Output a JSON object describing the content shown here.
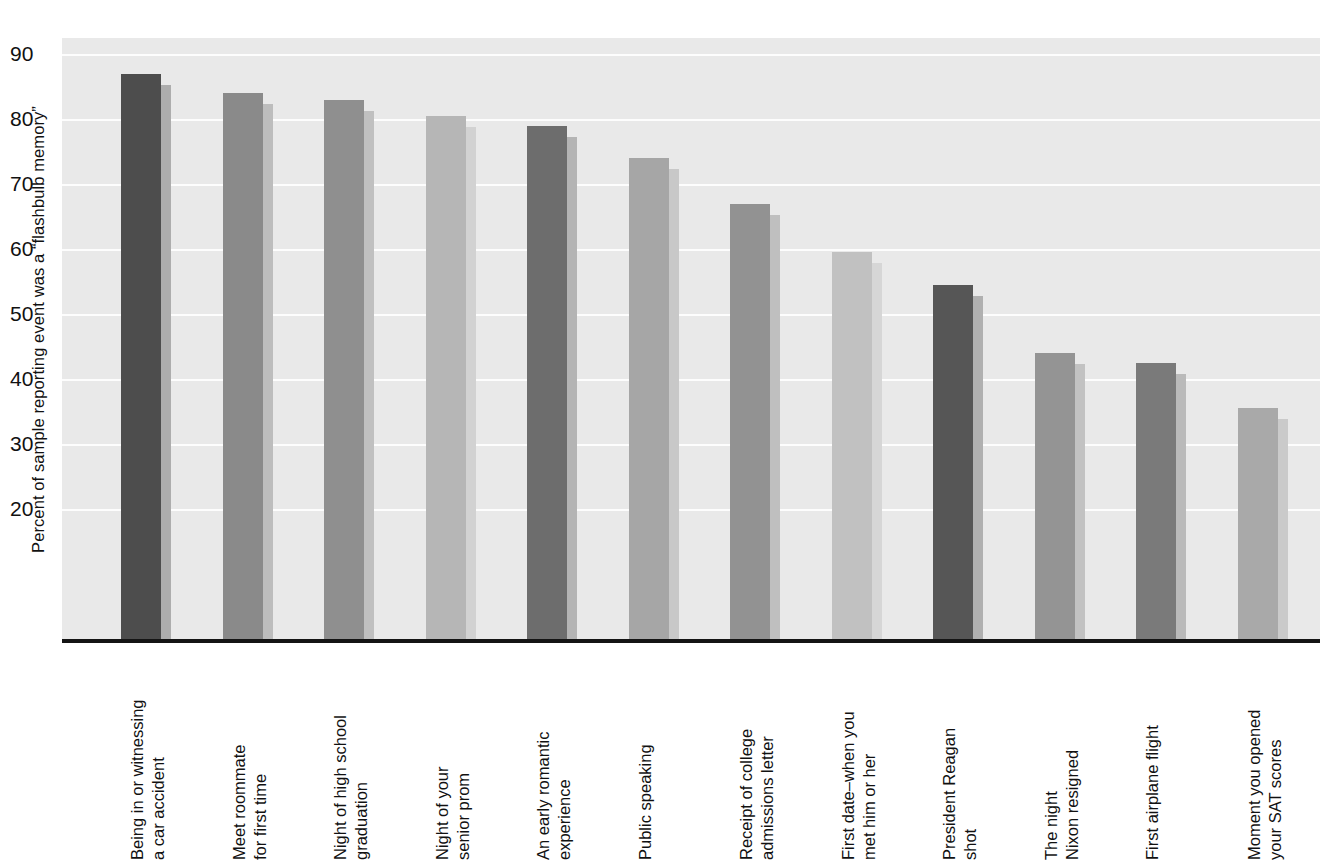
{
  "chart_data": {
    "type": "bar",
    "title": "",
    "xlabel": "",
    "ylabel": "Percent of sample reporting event was a “flashbulb memory”",
    "ylim": [
      0,
      95
    ],
    "yticks": [
      90,
      80,
      70,
      60,
      50,
      40,
      30,
      20
    ],
    "grid": true,
    "legend": "none",
    "categories": [
      "Being in or witnessing a car accident",
      "Meet roommate for first time",
      "Night of high school graduation",
      "Night of your senior prom",
      "An early romantic experience",
      "Public speaking",
      "Receipt of college admissions letter",
      "First date–when you met him or her",
      "President Reagan shot",
      "The night Nixon resigned",
      "First airplane flight",
      "Moment you opened your SAT scores"
    ],
    "values": [
      87,
      84,
      83,
      80.5,
      79,
      74,
      67,
      59.5,
      54.5,
      44,
      42.5,
      35.5
    ]
  },
  "axis": {
    "y_title": "Percent of sample reporting event was a “flashbulb memory”",
    "ticks": [
      {
        "value": 90,
        "label": "90"
      },
      {
        "value": 80,
        "label": "80"
      },
      {
        "value": 70,
        "label": "70"
      },
      {
        "value": 60,
        "label": "60"
      },
      {
        "value": 50,
        "label": "50"
      },
      {
        "value": 40,
        "label": "40"
      },
      {
        "value": 30,
        "label": "30"
      },
      {
        "value": 20,
        "label": "20"
      }
    ]
  },
  "bars": [
    {
      "line1": "Being in or witnessing",
      "line2": "a car accident",
      "value": 87,
      "face": "#4d4d4d",
      "side": "#adadad"
    },
    {
      "line1": "Meet roommate",
      "line2": "for first time",
      "value": 84,
      "face": "#8a8a8a",
      "side": "#bdbdbd"
    },
    {
      "line1": "Night of high school",
      "line2": "graduation",
      "value": 83,
      "face": "#8f8f8f",
      "side": "#c0c0c0"
    },
    {
      "line1": "Night of your",
      "line2": "senior prom",
      "value": 80.5,
      "face": "#b6b6b6",
      "side": "#d2d2d2"
    },
    {
      "line1": "An early romantic",
      "line2": "experience",
      "value": 79,
      "face": "#6d6d6d",
      "side": "#b4b4b4"
    },
    {
      "line1": "Public speaking",
      "line2": "",
      "value": 74,
      "face": "#a6a6a6",
      "side": "#c8c8c8"
    },
    {
      "line1": "Receipt of college",
      "line2": "admissions letter",
      "value": 67,
      "face": "#929292",
      "side": "#bfbfbf"
    },
    {
      "line1": "First date–when you",
      "line2": "met him or her",
      "value": 59.5,
      "face": "#c1c1c1",
      "side": "#d6d6d6"
    },
    {
      "line1": "President Reagan",
      "line2": "shot",
      "value": 54.5,
      "face": "#565656",
      "side": "#b0b0b0"
    },
    {
      "line1": "The night",
      "line2": "Nixon resigned",
      "value": 44,
      "face": "#949494",
      "side": "#c2c2c2"
    },
    {
      "line1": "First airplane flight",
      "line2": "",
      "value": 42.5,
      "face": "#7a7a7a",
      "side": "#bababa"
    },
    {
      "line1": "Moment you opened",
      "line2": "your SAT scores",
      "value": 35.5,
      "face": "#a9a9a9",
      "side": "#cacaca"
    }
  ],
  "style": {
    "plot_background": "#e9e9e9",
    "gridline_color": "#fdfdfd",
    "axis_color": "#141414",
    "text_color": "#111111"
  }
}
